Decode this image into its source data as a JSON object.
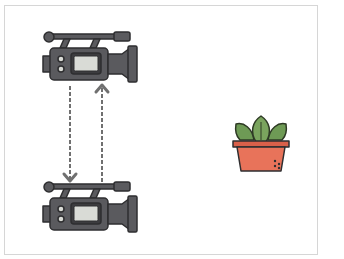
{
  "scene": {
    "description": "Two video cameras stacked vertically with dashed arrows between them, and a potted plant to the right",
    "colors": {
      "camera_body": "#5a5a5e",
      "camera_outline": "#2e2e30",
      "camera_screen": "#d9dbd6",
      "arrow": "#707070",
      "leaf": "#6e9a55",
      "leaf_outline": "#2e3a25",
      "pot": "#e8735a",
      "pot_rim": "#d9604a",
      "frame_border": "#d6d6d6"
    }
  },
  "cameras": [
    {
      "id": "camera-top",
      "x": 40,
      "y": 30
    },
    {
      "id": "camera-bottom",
      "x": 40,
      "y": 180
    }
  ],
  "arrows": [
    {
      "id": "arrow-down",
      "direction": "down",
      "x": 70,
      "y1": 86,
      "y2": 184
    },
    {
      "id": "arrow-up",
      "direction": "up",
      "x": 102,
      "y1": 184,
      "y2": 84
    }
  ],
  "plant": {
    "leaves": 3
  }
}
